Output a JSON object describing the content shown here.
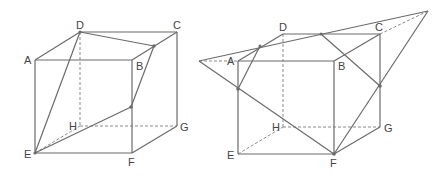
{
  "figures": [
    {
      "id": "left-cube",
      "labels": {
        "A": "A",
        "B": "B",
        "C": "C",
        "D": "D",
        "E": "E",
        "F": "F",
        "G": "G",
        "H": "H"
      },
      "description": "Cube ABCD-EFGH with section through E, D, a point on BC and a point on BF"
    },
    {
      "id": "right-cube",
      "labels": {
        "A": "A",
        "B": "B",
        "C": "C",
        "D": "D",
        "E": "E",
        "F": "F",
        "G": "G",
        "H": "H"
      },
      "description": "Cube ABCD-EFGH with extended section plane through F forming a large triangle"
    }
  ],
  "colors": {
    "line": "#6b6b6b",
    "dashed": "#8a8a8a",
    "label": "#444444"
  }
}
